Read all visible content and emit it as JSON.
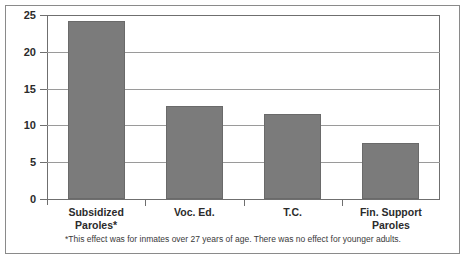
{
  "chart_data": {
    "type": "bar",
    "title": "",
    "xlabel": "",
    "ylabel": "",
    "categories": [
      "Subsidized\nParoles*",
      "Voc. Ed.",
      "T.C.",
      "Fin. Support\nParoles"
    ],
    "values": [
      24.2,
      12.7,
      11.6,
      7.6
    ],
    "ylim": [
      0,
      25
    ],
    "yticks": [
      0,
      5,
      10,
      15,
      20,
      25
    ],
    "ytick_labels": [
      "0",
      "5",
      "10",
      "15",
      "20",
      "25"
    ],
    "grid": true,
    "legend": null,
    "bar_color": "#7b7b7b",
    "annotations": [
      "*This effect was for inmates over 27 years of age. There was no effect for younger adults."
    ]
  },
  "footnote": "*This effect was for inmates over 27 years of age. There was no effect for younger adults."
}
